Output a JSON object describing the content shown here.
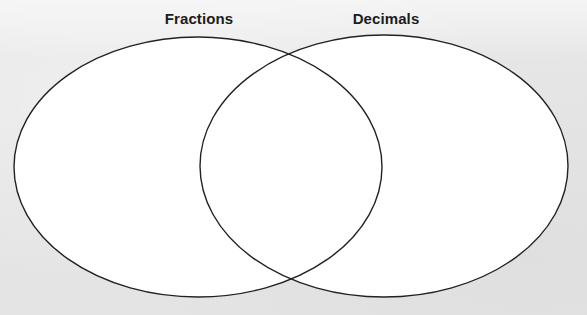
{
  "diagram": {
    "type": "venn",
    "sets": [
      {
        "id": "fractions",
        "label": "Fractions",
        "cx": 198,
        "cy": 167,
        "rx": 184,
        "ry": 130
      },
      {
        "id": "decimals",
        "label": "Decimals",
        "cx": 384,
        "cy": 166,
        "rx": 184,
        "ry": 131
      }
    ],
    "regions": {
      "fractions_only": "",
      "both": "",
      "decimals_only": ""
    },
    "colors": {
      "outline": "#222222",
      "fill": "#ffffff",
      "label": "#1c1c1c",
      "background": "#e6e6e6"
    }
  }
}
